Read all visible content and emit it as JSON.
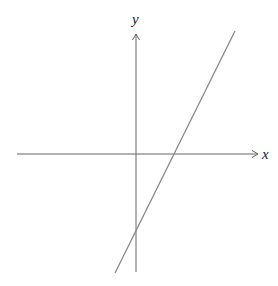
{
  "diagram": {
    "axes": {
      "x_label": "x",
      "y_label": "y",
      "color": "#666666"
    },
    "line": {
      "color": "#888888",
      "description": "straight line with positive slope, positive x-intercept, negative y-intercept"
    }
  }
}
